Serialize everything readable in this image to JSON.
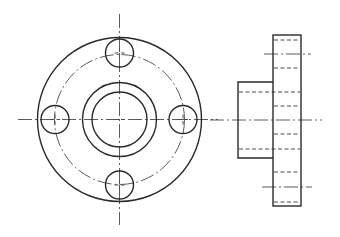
{
  "drawing": {
    "title": "",
    "type": "orthographic-projection",
    "subject": "bolted pipe flange",
    "colors": {
      "line": "#2a2a2a",
      "background": "#ffffff"
    },
    "front_view": {
      "center": [
        119.5,
        119.5
      ],
      "outer_circle_radius": 82,
      "bolt_circle_radius": 65,
      "hub_outer_radius": 37,
      "bore_radius": 27.5,
      "bolt_hole_radius": 14,
      "bolt_holes": [
        {
          "position": "top",
          "center": [
            119.5,
            53
          ]
        },
        {
          "position": "left",
          "center": [
            55,
            119.5
          ]
        },
        {
          "position": "right",
          "center": [
            183,
            119.5
          ]
        },
        {
          "position": "bottom",
          "center": [
            119.5,
            185
          ]
        }
      ],
      "centerlines": {
        "horizontal": {
          "x1": 18,
          "x2": 218,
          "y": 119.5
        },
        "vertical": {
          "x": 119.5,
          "y1": 14,
          "y2": 225
        }
      }
    },
    "side_view": {
      "flange_rect": {
        "x": 273,
        "y": 35,
        "w": 28,
        "h": 171
      },
      "hub_rect": {
        "x": 238,
        "y": 82,
        "w": 35,
        "h": 76
      },
      "hidden_lines_flange": [
        40,
        68,
        106,
        134,
        172,
        202
      ],
      "hidden_lines_through": [
        92,
        149
      ],
      "centerlines": [
        {
          "x1": 264,
          "x2": 311,
          "y": 54
        },
        {
          "x1": 210,
          "x2": 322,
          "y": 120
        },
        {
          "x1": 262,
          "x2": 312,
          "y": 187
        }
      ]
    }
  }
}
